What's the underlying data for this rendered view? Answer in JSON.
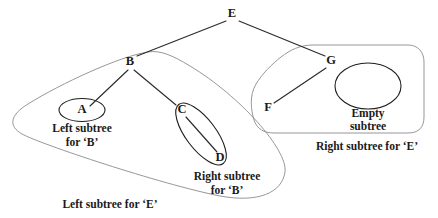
{
  "diagram": {
    "background_color": "#ffffff",
    "edge_color": "#2b2b2b",
    "outline_color": "#8b8b8b",
    "node_stroke_color": "#1f1f1f",
    "text_color": "#1a1a1a"
  },
  "nodes": {
    "e": {
      "label": "E",
      "x": 232,
      "y": 14
    },
    "b": {
      "label": "B",
      "x": 130,
      "y": 62
    },
    "g": {
      "label": "G",
      "x": 331,
      "y": 61
    },
    "a": {
      "label": "A",
      "x": 82,
      "y": 110
    },
    "c": {
      "label": "C",
      "x": 182,
      "y": 110
    },
    "d": {
      "label": "D",
      "x": 220,
      "y": 158
    },
    "f": {
      "label": "F",
      "x": 268,
      "y": 108
    }
  },
  "edges": [
    {
      "name": "edge-e-b",
      "from": "E",
      "to": "B"
    },
    {
      "name": "edge-e-g",
      "from": "E",
      "to": "G"
    },
    {
      "name": "edge-b-a",
      "from": "B",
      "to": "A"
    },
    {
      "name": "edge-b-c",
      "from": "B",
      "to": "C"
    },
    {
      "name": "edge-c-d",
      "from": "C",
      "to": "D"
    },
    {
      "name": "edge-g-f",
      "from": "G",
      "to": "F"
    }
  ],
  "captions": {
    "left_subtree_b": {
      "line1": "Left subtree",
      "line2": "for ‘B’"
    },
    "right_subtree_b": {
      "line1": "Right subtree",
      "line2": "for ‘B’"
    },
    "left_subtree_e": {
      "line1": "Left subtree for ‘E’"
    },
    "right_subtree_e": {
      "line1": "Right subtree for ‘E’"
    },
    "empty_subtree": {
      "line1": "Empty",
      "line2": "subtree"
    }
  },
  "groups": {
    "left_subtree_e_region": "left-subtree-e-outline",
    "right_subtree_e_region": "right-subtree-e-outline",
    "left_subtree_b_region": "node-a-ellipse",
    "right_subtree_b_region": "c-d-ellipse",
    "empty_subtree_region": "empty-subtree-circle"
  }
}
